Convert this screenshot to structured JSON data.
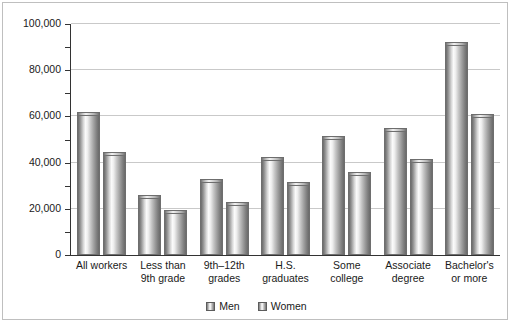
{
  "chart_data": {
    "type": "bar",
    "title": "",
    "subtitle": "",
    "xlabel": "",
    "ylabel": "",
    "ylim": [
      0,
      100000
    ],
    "ytick_values": [
      0,
      20000,
      40000,
      60000,
      80000,
      100000
    ],
    "ytick_labels": [
      "0",
      "20,000",
      "40,000",
      "60,000",
      "80,000",
      "100,000"
    ],
    "yminor_values": [
      10000,
      30000,
      50000,
      70000,
      90000
    ],
    "grid": true,
    "grid_axis": "y",
    "legend_position": "bottom",
    "categories": [
      "All workers",
      "Less than 9th grade",
      "9th–12th grades",
      "H.S. graduates",
      "Some college",
      "Associate degree",
      "Bachelor's or more"
    ],
    "category_lines": [
      [
        "All workers"
      ],
      [
        "Less than",
        "9th grade"
      ],
      [
        "9th–12th",
        "grades"
      ],
      [
        "H.S.",
        "graduates"
      ],
      [
        "Some",
        "college"
      ],
      [
        "Associate",
        "degree"
      ],
      [
        "Bachelor's",
        "or more"
      ]
    ],
    "series": [
      {
        "name": "Men",
        "values": [
          62000,
          26000,
          33000,
          42500,
          51500,
          55000,
          92000
        ]
      },
      {
        "name": "Women",
        "values": [
          44500,
          19500,
          23000,
          31500,
          36000,
          41500,
          61000
        ]
      }
    ]
  },
  "legend": {
    "items": [
      {
        "label": "Men"
      },
      {
        "label": "Women"
      }
    ]
  }
}
